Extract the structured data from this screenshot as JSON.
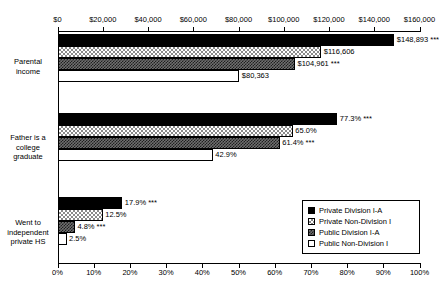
{
  "chart_data": {
    "type": "bar",
    "orientation": "horizontal",
    "title": "",
    "categories": [
      "Parental income",
      "Father is a college graduate",
      "Went to independent private HS"
    ],
    "category_labels": [
      [
        "Parental",
        "income"
      ],
      [
        "Father is a",
        "college",
        "graduate"
      ],
      [
        "Went to",
        "independent",
        "private HS"
      ]
    ],
    "series": [
      {
        "name": "Private Division I-A",
        "fill": "solid-black",
        "values": [
          148893,
          77.3,
          17.9
        ],
        "labels": [
          "$148,893 ***",
          "77.3% ***",
          "17.9% ***"
        ],
        "significance": [
          "***",
          "***",
          "***"
        ]
      },
      {
        "name": "Private Non-Division I",
        "fill": "light-checker",
        "values": [
          116606,
          65.0,
          12.5
        ],
        "labels": [
          "$116,606",
          "65.0%",
          "12.5%"
        ],
        "significance": [
          "",
          "",
          ""
        ]
      },
      {
        "name": "Public Division I-A",
        "fill": "dark-checker",
        "values": [
          104961,
          61.4,
          4.8
        ],
        "labels": [
          "$104,961 ***",
          "61.4% ***",
          "4.8% ***"
        ],
        "significance": [
          "***",
          "***",
          "***"
        ]
      },
      {
        "name": "Public Non-Division I",
        "fill": "hollow-white",
        "values": [
          80363,
          42.9,
          2.5
        ],
        "labels": [
          "$80,363",
          "42.9%",
          "2.5%"
        ],
        "significance": [
          "",
          "",
          ""
        ]
      }
    ],
    "top_axis": {
      "position": "top",
      "label": "",
      "applies_to_category": "Parental income",
      "min": 0,
      "max": 160000,
      "step": 20000,
      "tick_labels": [
        "$0",
        "$20,000",
        "$40,000",
        "$60,000",
        "$80,000",
        "$100,000",
        "$120,000",
        "$140,000",
        "$160,000"
      ]
    },
    "bottom_axis": {
      "position": "bottom",
      "label": "",
      "applies_to_categories": [
        "Father is a college graduate",
        "Went to independent private HS"
      ],
      "min": 0,
      "max": 100,
      "step": 10,
      "tick_labels": [
        "0%",
        "10%",
        "20%",
        "30%",
        "40%",
        "50%",
        "60%",
        "70%",
        "80%",
        "90%",
        "100%"
      ]
    },
    "grid": false,
    "legend": {
      "position": "bottom-right",
      "entries": [
        {
          "label": "Private Division I-A",
          "fill": "solid-black"
        },
        {
          "label": "Private Non-Division I",
          "fill": "light-checker"
        },
        {
          "label": "Public Division I-A",
          "fill": "dark-checker"
        },
        {
          "label": "Public Non-Division I",
          "fill": "hollow-white"
        }
      ]
    },
    "colors": {
      "axis": "#000000",
      "text": "#000000",
      "series1": "#000000",
      "series2": "#8a8a8a",
      "series3": "#3a3a3a",
      "series4": "#ffffff",
      "background": "#ffffff"
    }
  }
}
